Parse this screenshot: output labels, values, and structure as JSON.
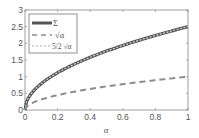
{
  "chart_data": {
    "type": "line",
    "title": "",
    "xlabel": "α",
    "ylabel": "",
    "xlim": [
      0,
      1
    ],
    "ylim": [
      0,
      3
    ],
    "xticks": [
      0,
      0.2,
      0.4,
      0.6,
      0.8,
      1
    ],
    "xtick_labels": [
      "0",
      "0.2",
      "0.4",
      "0.6",
      "0.8",
      "1"
    ],
    "yticks": [
      0,
      0.5,
      1,
      1.5,
      2,
      2.5,
      3
    ],
    "ytick_labels": [
      "0",
      "0.5",
      "1",
      "1.5",
      "2",
      "2.5",
      "3"
    ],
    "grid": false,
    "legend_position": "upper left",
    "x": [
      0,
      0.01,
      0.05,
      0.1,
      0.2,
      0.3,
      0.4,
      0.5,
      0.6,
      0.7,
      0.8,
      0.9,
      1.0
    ],
    "series": [
      {
        "name": "Σ",
        "style": "thick solid",
        "color": "#555555",
        "values": [
          0,
          0.25,
          0.56,
          0.79,
          1.12,
          1.37,
          1.58,
          1.77,
          1.94,
          2.09,
          2.24,
          2.37,
          2.5
        ]
      },
      {
        "name": "√α",
        "style": "dashed",
        "color": "#8c8c8c",
        "values": [
          0,
          0.1,
          0.22,
          0.32,
          0.45,
          0.55,
          0.63,
          0.71,
          0.77,
          0.84,
          0.89,
          0.95,
          1.0
        ]
      },
      {
        "name": "(5/2)√α",
        "style": "dotted",
        "color": "#b0b0b0",
        "values": [
          0,
          0.25,
          0.56,
          0.79,
          1.12,
          1.37,
          1.58,
          1.77,
          1.94,
          2.09,
          2.24,
          2.37,
          2.5
        ]
      }
    ]
  },
  "legend": {
    "items": [
      {
        "label": "Σ"
      },
      {
        "label": "√α"
      },
      {
        "label": "5/2 √α"
      }
    ]
  },
  "axes": {
    "xlabel": "α"
  }
}
